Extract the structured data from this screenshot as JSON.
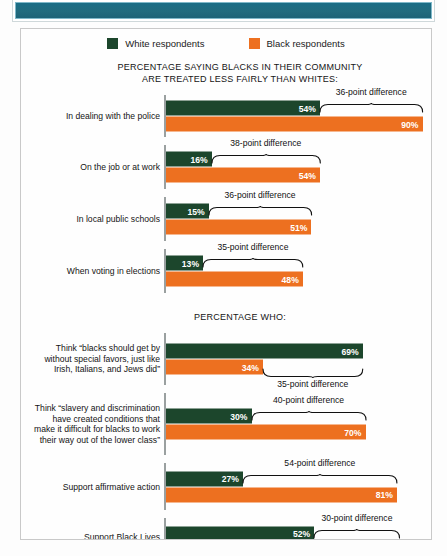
{
  "banner": {
    "text": ""
  },
  "legend": [
    {
      "label": "White respondents",
      "color": "#1c462c",
      "icon": "square-swatch"
    },
    {
      "label": "Black respondents",
      "color": "#ed7020",
      "icon": "square-swatch"
    }
  ],
  "sections": [
    {
      "title_line1": "PERCENTAGE SAYING BLACKS IN THEIR COMMUNITY",
      "title_line2": "ARE TREATED LESS FAIRLY THAN WHITES:"
    },
    {
      "title_line1": "PERCENTAGE WHO:",
      "title_line2": ""
    }
  ],
  "chart_data": {
    "type": "bar",
    "orientation": "horizontal",
    "title": "",
    "xlabel": "",
    "ylabel": "",
    "xlim": [
      0,
      100
    ],
    "grid": false,
    "legend_position": "top-center",
    "colors": {
      "white_respondents": "#1c462c",
      "black_respondents": "#ed7020",
      "banner": "#1d6a80"
    },
    "series": [
      {
        "name": "White respondents",
        "color": "#1c462c"
      },
      {
        "name": "Black respondents",
        "color": "#ed7020"
      }
    ],
    "sections": [
      {
        "heading": "PERCENTAGE SAYING BLACKS IN THEIR COMMUNITY ARE TREATED LESS FAIRLY THAN WHITES:",
        "categories": [
          "In dealing with the police",
          "On the job or at work",
          "In local public schools",
          "When voting in elections"
        ],
        "white_values": [
          54,
          16,
          15,
          13
        ],
        "black_values": [
          90,
          54,
          51,
          48
        ],
        "differences": [
          36,
          38,
          36,
          35
        ],
        "difference_labels": [
          "36-point difference",
          "38-point difference",
          "36-point difference",
          "35-point difference"
        ],
        "value_labels_white": [
          "54%",
          "16%",
          "15%",
          "13%"
        ],
        "value_labels_black": [
          "90%",
          "54%",
          "51%",
          "48%"
        ],
        "brace_above": [
          true,
          true,
          true,
          true
        ]
      },
      {
        "heading": "PERCENTAGE WHO:",
        "categories": [
          "Think “blacks should get by without special favors, just like Irish, Italians, and Jews did”",
          "Think “slavery and discrimination have created conditions that make it difficult for blacks to work their way out of the lower class”",
          "Support affirmative action",
          "Support Black Lives Matter movement"
        ],
        "white_values": [
          69,
          30,
          27,
          52
        ],
        "black_values": [
          34,
          70,
          81,
          82
        ],
        "differences": [
          35,
          40,
          54,
          30
        ],
        "difference_labels": [
          "35-point difference",
          "40-point difference",
          "54-point difference",
          "30-point difference"
        ],
        "value_labels_white": [
          "69%",
          "30%",
          "27%",
          "52%"
        ],
        "value_labels_black": [
          "34%",
          "70%",
          "81%",
          "82%"
        ],
        "brace_above": [
          false,
          true,
          true,
          true
        ]
      }
    ]
  },
  "rows": [
    {
      "label_lines": [
        "In dealing with the police"
      ],
      "white": 54,
      "black": 90,
      "white_label": "54%",
      "black_label": "90%",
      "diff_label": "36-point difference",
      "brace_above": true
    },
    {
      "label_lines": [
        "On the job or at work"
      ],
      "white": 16,
      "black": 54,
      "white_label": "16%",
      "black_label": "54%",
      "diff_label": "38-point difference",
      "brace_above": true
    },
    {
      "label_lines": [
        "In local public schools"
      ],
      "white": 15,
      "black": 51,
      "white_label": "15%",
      "black_label": "51%",
      "diff_label": "36-point difference",
      "brace_above": true
    },
    {
      "label_lines": [
        "When voting in elections"
      ],
      "white": 13,
      "black": 48,
      "white_label": "13%",
      "black_label": "48%",
      "diff_label": "35-point difference",
      "brace_above": true
    },
    {
      "label_lines": [
        "Think “blacks should get by",
        "without special favors, just like",
        "Irish, Italians, and Jews did”"
      ],
      "white": 69,
      "black": 34,
      "white_label": "69%",
      "black_label": "34%",
      "diff_label": "35-point difference",
      "brace_above": false
    },
    {
      "label_lines": [
        "Think “slavery and discrimination",
        "have created conditions that",
        "make it difficult for blacks to work",
        "their way out of the lower class”"
      ],
      "white": 30,
      "black": 70,
      "white_label": "30%",
      "black_label": "70%",
      "diff_label": "40-point difference",
      "brace_above": true
    },
    {
      "label_lines": [
        "Support affirmative action"
      ],
      "white": 27,
      "black": 81,
      "white_label": "27%",
      "black_label": "81%",
      "diff_label": "54-point difference",
      "brace_above": true
    },
    {
      "label_lines": [
        "Support Black Lives",
        "Matter movement"
      ],
      "white": 52,
      "black": 82,
      "white_label": "52%",
      "black_label": "82%",
      "diff_label": "30-point difference",
      "brace_above": true
    }
  ]
}
